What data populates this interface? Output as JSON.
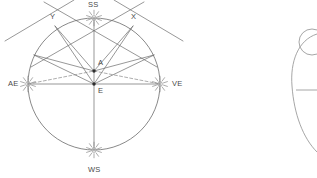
{
  "figure": {
    "canvas": {
      "width": 317,
      "height": 178
    },
    "stroke_color": "#6b6b6b",
    "accent_color": "#888888",
    "dash_color": "#8a8a8a",
    "label_color": "#4a4a4a",
    "background": "#ffffff"
  },
  "labels": [
    {
      "id": "SS",
      "text": "SS",
      "x": 88,
      "y": 1,
      "name": "label-summer-solstice"
    },
    {
      "id": "WS",
      "text": "WS",
      "x": 88,
      "y": 166,
      "name": "label-winter-solstice"
    },
    {
      "id": "AE",
      "text": "AE",
      "x": 8,
      "y": 80,
      "name": "label-autumnal-equinox"
    },
    {
      "id": "VE",
      "text": "VE",
      "x": 172,
      "y": 80,
      "name": "label-vernal-equinox"
    },
    {
      "id": "X",
      "text": "X",
      "x": 131,
      "y": 13,
      "name": "label-point-x"
    },
    {
      "id": "Y",
      "text": "Y",
      "x": 50,
      "y": 13,
      "name": "label-point-y"
    },
    {
      "id": "A",
      "text": "A",
      "x": 98,
      "y": 59,
      "name": "label-point-a"
    },
    {
      "id": "E",
      "text": "E",
      "x": 98,
      "y": 87,
      "name": "label-point-e"
    }
  ],
  "points": {
    "E": {
      "x": 94,
      "y": 84,
      "label": "E",
      "name": "center-point-e"
    },
    "A": {
      "x": 94,
      "y": 71,
      "label": "A",
      "name": "offset-point-a"
    },
    "SS": {
      "x": 94,
      "y": 18,
      "label": "SS",
      "name": "sun-summer-solstice"
    },
    "WS": {
      "x": 94,
      "y": 150,
      "label": "WS",
      "name": "sun-winter-solstice"
    },
    "AE": {
      "x": 28,
      "y": 84,
      "label": "AE",
      "name": "sun-autumnal-equinox"
    },
    "VE": {
      "x": 160,
      "y": 84,
      "label": "VE",
      "name": "sun-vernal-equinox"
    },
    "X": {
      "x": 133,
      "y": 26,
      "label": "X",
      "name": "circle-point-x"
    },
    "Y": {
      "x": 55,
      "y": 26,
      "label": "Y",
      "name": "circle-point-y"
    },
    "L": {
      "x": 34,
      "y": 55,
      "label": "",
      "name": "circle-point-left"
    },
    "R": {
      "x": 154,
      "y": 55,
      "label": "",
      "name": "circle-point-right"
    }
  },
  "circle": {
    "cx": 94,
    "cy": 84,
    "r": 66,
    "name": "main-circle"
  },
  "suns": [
    {
      "id": "SS",
      "cx": 94,
      "cy": 18,
      "r": 4.2,
      "rays": 10,
      "name": "sun-icon-ss"
    },
    {
      "id": "AE",
      "cx": 28,
      "cy": 84,
      "r": 4.2,
      "rays": 10,
      "name": "sun-icon-ae"
    },
    {
      "id": "VE",
      "cx": 160,
      "cy": 84,
      "r": 4.2,
      "rays": 10,
      "name": "sun-icon-ve"
    },
    {
      "id": "WS",
      "cx": 94,
      "cy": 150,
      "r": 4.2,
      "rays": 10,
      "name": "sun-icon-ws"
    }
  ],
  "solid_lines": [
    {
      "x1": 94,
      "y1": 18,
      "x2": 94,
      "y2": 150,
      "name": "vertical-axis-ss-ws"
    },
    {
      "x1": 28,
      "y1": 84,
      "x2": 160,
      "y2": 84,
      "name": "horizontal-axis-ae-ve"
    },
    {
      "x1": 94,
      "y1": 84,
      "x2": 133,
      "y2": 26,
      "name": "ray-e-to-x"
    },
    {
      "x1": 94,
      "y1": 84,
      "x2": 55,
      "y2": 26,
      "name": "ray-e-to-y"
    },
    {
      "x1": 94,
      "y1": 71,
      "x2": 133,
      "y2": 26,
      "name": "ray-a-to-x"
    },
    {
      "x1": 94,
      "y1": 71,
      "x2": 55,
      "y2": 26,
      "name": "ray-a-to-y"
    },
    {
      "x1": 94,
      "y1": 84,
      "x2": 34,
      "y2": 55,
      "name": "ray-e-to-left"
    },
    {
      "x1": 94,
      "y1": 84,
      "x2": 154,
      "y2": 55,
      "name": "ray-e-to-right"
    },
    {
      "x1": 94,
      "y1": 71,
      "x2": 34,
      "y2": 55,
      "name": "ray-a-to-left"
    },
    {
      "x1": 94,
      "y1": 71,
      "x2": 154,
      "y2": 55,
      "name": "ray-a-to-right"
    },
    {
      "x1": 144,
      "y1": 2,
      "x2": 31,
      "y2": 67,
      "name": "chord-upper-right-to-left"
    },
    {
      "x1": 44,
      "y1": 2,
      "x2": 157,
      "y2": 67,
      "name": "chord-upper-left-to-right"
    },
    {
      "x1": 5,
      "y1": 41,
      "x2": 74,
      "y2": 0,
      "name": "extension-left-upper"
    },
    {
      "x1": 183,
      "y1": 41,
      "x2": 114,
      "y2": 0,
      "name": "extension-right-upper"
    }
  ],
  "dashed_lines": [
    {
      "x1": 28,
      "y1": 84,
      "x2": 94,
      "y2": 71,
      "name": "dashed-ae-to-a"
    },
    {
      "x1": 94,
      "y1": 71,
      "x2": 160,
      "y2": 84,
      "name": "dashed-a-to-ve"
    }
  ],
  "inset": {
    "name": "partial-figure-right",
    "arc_path": "M 317 34 C 298 40 290 62 292 86 C 294 114 303 138 317 152",
    "small_circle": {
      "cx": 312,
      "cy": 42,
      "r": 13
    },
    "connector": {
      "x1": 296,
      "y1": 90,
      "x2": 317,
      "y2": 90
    }
  }
}
